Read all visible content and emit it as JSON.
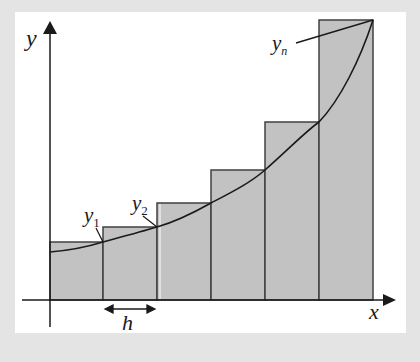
{
  "diagram": {
    "title": "",
    "type": "riemann-sum-right-endpoints",
    "axes": {
      "x_label": "x",
      "y_label": "y"
    },
    "labels": {
      "y1": {
        "base": "y",
        "sub": "1"
      },
      "y2": {
        "base": "y",
        "sub": "2"
      },
      "yn": {
        "base": "y",
        "sub": "n"
      },
      "h": "h"
    },
    "rectangles": {
      "count": 6,
      "fill": "#c2c2c2",
      "stroke": "#404040"
    },
    "colors": {
      "frame": "#e4e4e4",
      "panel": "#ffffff",
      "line": "#1a1a1a"
    }
  }
}
